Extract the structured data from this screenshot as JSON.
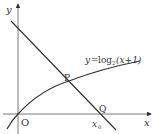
{
  "diagram": {
    "axes": {
      "x_label": "x",
      "y_label": "y",
      "origin_label": "O"
    },
    "curve": {
      "equation_lhs": "y",
      "equation_eq": "=",
      "equation_fn": "log",
      "equation_base": "2",
      "equation_arg": "(x+1)"
    },
    "points": {
      "p_label": "P",
      "q_label": "Q"
    },
    "x_intercept": {
      "label": "x",
      "subscript": "0"
    },
    "colors": {
      "stroke": "#333333",
      "background": "#ffffff"
    }
  }
}
